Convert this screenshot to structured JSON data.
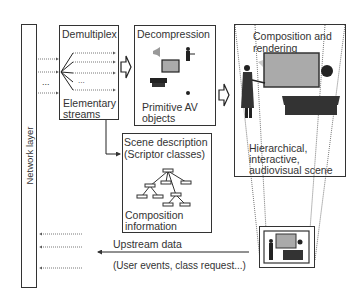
{
  "network_layer": {
    "label": "Network layer"
  },
  "demultiplex": {
    "title": "Demultiplex",
    "caption_line1": "Elementary",
    "caption_line2": "streams",
    "ellipsis": "..."
  },
  "decompression": {
    "title": "Decompression",
    "caption_line1": "Primitive AV",
    "caption_line2": "objects"
  },
  "composition": {
    "title_line1": "Composition and",
    "title_line2": "rendering",
    "caption_line1": "Hierarchical,",
    "caption_line2": "interactive,",
    "caption_line3": "audiovisual scene"
  },
  "scene_description": {
    "title_line1": "Scene description",
    "title_line2": "(Scriptor classes)",
    "caption_line1": "Composition",
    "caption_line2": "information"
  },
  "upstream": {
    "label": "Upstream data",
    "sublabel": "(User events, class request...)"
  },
  "input_ellipsis": "..."
}
